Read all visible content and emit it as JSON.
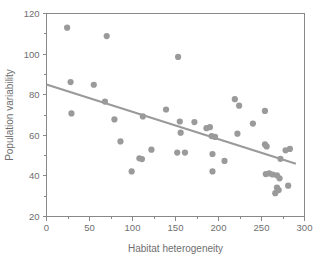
{
  "chart_data": {
    "type": "scatter",
    "title": "",
    "xlabel": "Habitat heterogeneity",
    "ylabel": "Population variability",
    "xlim": [
      0,
      300
    ],
    "ylim": [
      20,
      120
    ],
    "xticks": [
      0,
      50,
      100,
      150,
      200,
      250,
      300
    ],
    "xtick_labels": [
      "0",
      "50",
      "100",
      "150",
      "200",
      "250",
      "300"
    ],
    "xminor_ticks": [
      25,
      75,
      125,
      175,
      225,
      275
    ],
    "yticks": [
      20,
      40,
      60,
      80,
      100,
      120
    ],
    "ytick_labels": [
      "20",
      "40",
      "60",
      "80",
      "100",
      "120"
    ],
    "yminor_ticks": [
      30,
      50,
      70,
      90,
      110
    ],
    "grid": false,
    "legend": null,
    "marker_color": "#9a9a9a",
    "line_color": "#9a9a9a",
    "axis_color": "#888888",
    "text_color": "#6e6e6e",
    "marker_radius": 3.1,
    "points": [
      [
        24,
        113.0
      ],
      [
        28,
        86.2
      ],
      [
        29,
        70.8
      ],
      [
        55,
        84.9
      ],
      [
        68,
        76.6
      ],
      [
        70,
        108.9
      ],
      [
        79,
        67.8
      ],
      [
        86,
        57.0
      ],
      [
        99,
        42.2
      ],
      [
        108,
        48.7
      ],
      [
        111,
        48.3
      ],
      [
        112,
        69.3
      ],
      [
        122,
        52.9
      ],
      [
        139,
        72.7
      ],
      [
        152,
        51.5
      ],
      [
        153,
        98.6
      ],
      [
        155,
        66.8
      ],
      [
        156,
        61.3
      ],
      [
        161,
        51.5
      ],
      [
        172,
        66.5
      ],
      [
        186,
        63.5
      ],
      [
        190,
        64.0
      ],
      [
        192,
        59.6
      ],
      [
        193,
        50.8
      ],
      [
        193,
        42.2
      ],
      [
        196,
        59.2
      ],
      [
        207,
        47.4
      ],
      [
        219,
        77.8
      ],
      [
        222,
        60.8
      ],
      [
        224,
        74.6
      ],
      [
        240,
        65.8
      ],
      [
        254,
        72.0
      ],
      [
        254,
        55.5
      ],
      [
        256,
        54.5
      ],
      [
        255,
        40.9
      ],
      [
        259,
        41.2
      ],
      [
        263,
        40.7
      ],
      [
        266,
        31.5
      ],
      [
        268,
        40.3
      ],
      [
        268,
        34.2
      ],
      [
        270,
        33.0
      ],
      [
        271,
        38.8
      ],
      [
        272,
        48.4
      ],
      [
        278,
        52.6
      ],
      [
        281,
        35.2
      ],
      [
        283,
        53.3
      ]
    ],
    "trend_line": {
      "x_start": 0,
      "y_start": 85.0,
      "x_end": 290,
      "y_end": 46.0
    }
  }
}
